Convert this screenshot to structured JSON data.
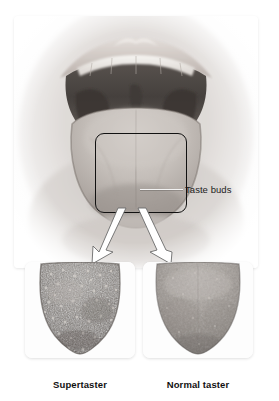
{
  "figure": {
    "main_photo": {
      "name": "open-mouth-photo",
      "subject": "open human mouth showing tongue, teeth and oral cavity"
    },
    "callout": {
      "box_label": "tongue-callout-box",
      "leader_label": "Taste buds"
    },
    "panels": [
      {
        "id": "supertaster",
        "caption": "Supertaster",
        "tongue_desc": "close-up of tongue tip densely covered with fungiform papillae",
        "papillae_density": "high"
      },
      {
        "id": "normal-taster",
        "caption": "Normal taster",
        "tongue_desc": "close-up of tongue tip with sparse fungiform papillae",
        "papillae_density": "low"
      }
    ],
    "colors": {
      "background": "#ffffff",
      "card": "#fbfbfb",
      "callout_stroke": "#111111",
      "arrow_fill": "#ffffff",
      "arrow_stroke": "#4a4a4a",
      "text": "#111111",
      "tongue_dark": "#6e6a66",
      "tongue_light": "#b5b0ab"
    }
  }
}
